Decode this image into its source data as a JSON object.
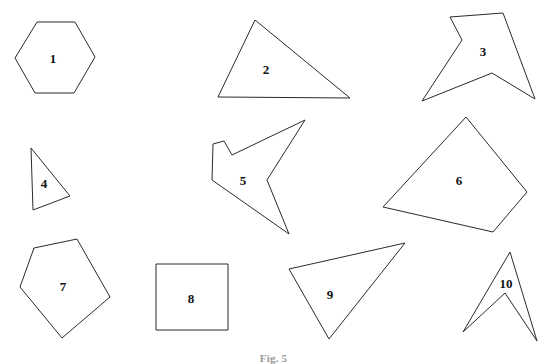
{
  "figure": {
    "caption": "Fig. 5",
    "background_color": "#ffffff",
    "stroke_color": "#2b2b2b",
    "label_color": "#111111",
    "width": 547,
    "height": 364
  },
  "shapes": [
    {
      "label": "1",
      "name": "hexagon",
      "points": "15,58 37,22 75,22 95,57 74,93 35,93",
      "label_x": 53,
      "label_y": 60
    },
    {
      "label": "2",
      "name": "triangle",
      "points": "255,20 350,98 218,97",
      "label_x": 266,
      "label_y": 71
    },
    {
      "label": "3",
      "name": "arrow-star",
      "points": "450,17 503,13 535,99 492,73 422,101 462,40",
      "label_x": 483,
      "label_y": 53
    },
    {
      "label": "4",
      "name": "triangle-small",
      "points": "31,148 70,196 33,210",
      "label_x": 44,
      "label_y": 185
    },
    {
      "label": "5",
      "name": "arrow-concave",
      "points": "305,120 232,155 224,141 213,144 212,180 289,234 267,180",
      "label_x": 243,
      "label_y": 182
    },
    {
      "label": "6",
      "name": "quadrilateral",
      "points": "466,117 527,192 493,232 383,207",
      "label_x": 459,
      "label_y": 182
    },
    {
      "label": "7",
      "name": "pentagon",
      "points": "77,239 110,297 62,338 20,287 34,248",
      "label_x": 63,
      "label_y": 288
    },
    {
      "label": "8",
      "name": "square",
      "points": "156,264 228,264 228,330 156,330",
      "label_x": 191,
      "label_y": 300
    },
    {
      "label": "9",
      "name": "triangle-obtuse",
      "points": "405,243 329,339 289,269",
      "label_x": 330,
      "label_y": 296
    },
    {
      "label": "10",
      "name": "dart",
      "points": "510,252 537,341 505,293 463,332",
      "label_x": 506,
      "label_y": 285
    }
  ]
}
